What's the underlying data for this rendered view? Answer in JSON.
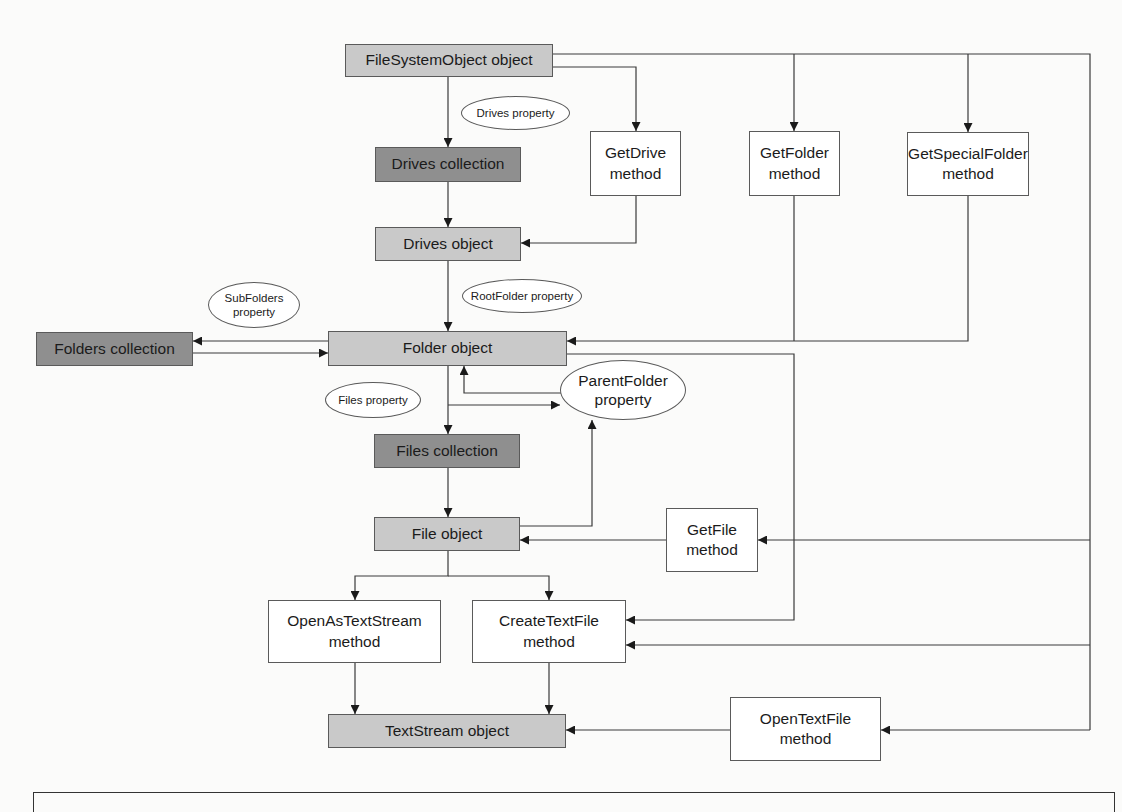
{
  "diagram": {
    "colors": {
      "object_fill": "#c9c9c9",
      "collection_fill": "#8f8f8f",
      "method_fill": "#ffffff",
      "line": "#3a3a3a"
    },
    "nodes": {
      "fso": "FileSystemObject object",
      "drives_collection": "Drives collection",
      "getdrive": "GetDrive\nmethod",
      "getfolder": "GetFolder\nmethod",
      "getspecialfolder": "GetSpecialFolder\nmethod",
      "drives_object": "Drives object",
      "folders_collection": "Folders collection",
      "folder_object": "Folder object",
      "files_collection": "Files collection",
      "file_object": "File object",
      "getfile": "GetFile\nmethod",
      "openastextstream": "OpenAsTextStream\nmethod",
      "createtextfile": "CreateTextFile\nmethod",
      "textstream_object": "TextStream object",
      "opentextfile": "OpenTextFile\nmethod"
    },
    "properties": {
      "drives": "Drives property",
      "rootfolder": "RootFolder property",
      "subfolders": "SubFolders\nproperty",
      "files": "Files property",
      "parentfolder": "ParentFolder\nproperty"
    }
  }
}
